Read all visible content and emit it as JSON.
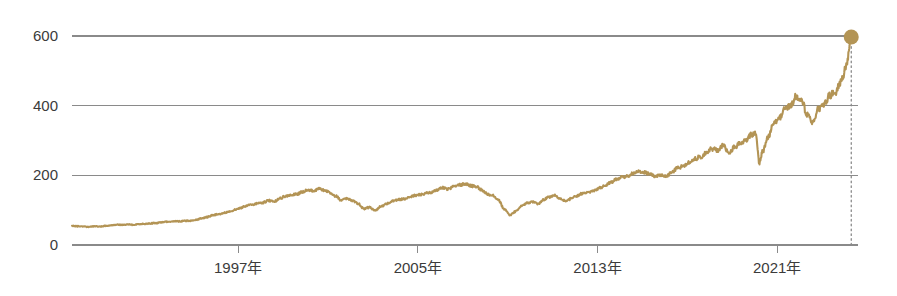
{
  "chart_data": {
    "type": "line",
    "title": "",
    "subtitle": "",
    "xlabel": "",
    "ylabel": "",
    "background_color": "#ffffff",
    "series_color": "#b39455",
    "grid_color": "#8a8a8a",
    "text_color": "#3b3b3b",
    "grid": true,
    "grid_axis": "y",
    "legend": false,
    "legend_position": "none",
    "xlim": [
      1989.6,
      2024.6
    ],
    "ylim": [
      0,
      640
    ],
    "ytick_labels": [
      "0",
      "200",
      "400",
      "600"
    ],
    "ytick_values": [
      0,
      200,
      400,
      600
    ],
    "xtick_labels": [
      "1997年",
      "2005年",
      "2013年",
      "2021年"
    ],
    "xtick_values": [
      1997,
      2005,
      2013,
      2021
    ],
    "end_marker": {
      "shape": "circle",
      "x": 2024.3,
      "y": 597,
      "color": "#b39455",
      "dropline": true,
      "dropline_style": "dotted"
    },
    "series": [
      {
        "name": "index",
        "x": [
          1989.6,
          1989.85,
          1990.1,
          1990.35,
          1990.6,
          1990.85,
          1991.1,
          1991.35,
          1991.6,
          1991.85,
          1992.1,
          1992.35,
          1992.6,
          1992.85,
          1993.1,
          1993.35,
          1993.6,
          1993.85,
          1994.1,
          1994.35,
          1994.6,
          1994.85,
          1995.1,
          1995.35,
          1995.6,
          1995.85,
          1996.1,
          1996.35,
          1996.6,
          1996.85,
          1997.1,
          1997.35,
          1997.6,
          1997.85,
          1998.1,
          1998.35,
          1998.6,
          1998.85,
          1999.1,
          1999.35,
          1999.6,
          1999.85,
          2000.1,
          2000.35,
          2000.6,
          2000.85,
          2001.1,
          2001.35,
          2001.6,
          2001.85,
          2002.1,
          2002.35,
          2002.6,
          2002.85,
          2003.1,
          2003.35,
          2003.6,
          2003.85,
          2004.1,
          2004.35,
          2004.6,
          2004.85,
          2005.1,
          2005.35,
          2005.6,
          2005.85,
          2006.1,
          2006.35,
          2006.6,
          2006.85,
          2007.1,
          2007.35,
          2007.6,
          2007.85,
          2008.1,
          2008.35,
          2008.6,
          2008.85,
          2009.1,
          2009.35,
          2009.6,
          2009.85,
          2010.1,
          2010.35,
          2010.6,
          2010.85,
          2011.1,
          2011.35,
          2011.6,
          2011.85,
          2012.1,
          2012.35,
          2012.6,
          2012.85,
          2013.1,
          2013.35,
          2013.6,
          2013.85,
          2014.1,
          2014.35,
          2014.6,
          2014.85,
          2015.1,
          2015.35,
          2015.6,
          2015.85,
          2016.1,
          2016.35,
          2016.6,
          2016.85,
          2017.1,
          2017.35,
          2017.6,
          2017.85,
          2018.1,
          2018.35,
          2018.6,
          2018.85,
          2019.1,
          2019.35,
          2019.6,
          2019.85,
          2020.05,
          2020.2,
          2020.35,
          2020.6,
          2020.85,
          2021.1,
          2021.35,
          2021.6,
          2021.85,
          2022.1,
          2022.35,
          2022.6,
          2022.85,
          2023.1,
          2023.35,
          2023.6,
          2023.85,
          2024.1,
          2024.3
        ],
        "y": [
          55,
          54,
          53,
          52,
          54,
          53,
          55,
          57,
          58,
          58,
          59,
          58,
          60,
          61,
          62,
          63,
          65,
          67,
          68,
          68,
          69,
          70,
          72,
          76,
          80,
          85,
          88,
          92,
          96,
          101,
          106,
          112,
          116,
          119,
          122,
          128,
          124,
          134,
          140,
          144,
          146,
          152,
          158,
          155,
          162,
          157,
          150,
          140,
          128,
          134,
          128,
          118,
          104,
          108,
          100,
          110,
          118,
          126,
          130,
          132,
          136,
          142,
          145,
          148,
          152,
          158,
          164,
          160,
          168,
          172,
          176,
          170,
          168,
          158,
          146,
          142,
          128,
          102,
          86,
          96,
          112,
          120,
          124,
          118,
          130,
          138,
          142,
          132,
          126,
          134,
          142,
          148,
          150,
          156,
          164,
          172,
          180,
          190,
          194,
          198,
          206,
          210,
          208,
          204,
          196,
          202,
          198,
          212,
          222,
          228,
          238,
          248,
          254,
          266,
          276,
          272,
          286,
          266,
          280,
          292,
          300,
          316,
          322,
          236,
          268,
          310,
          348,
          366,
          390,
          400,
          428,
          412,
          372,
          352,
          392,
          404,
          430,
          440,
          470,
          520,
          597
        ]
      }
    ]
  }
}
